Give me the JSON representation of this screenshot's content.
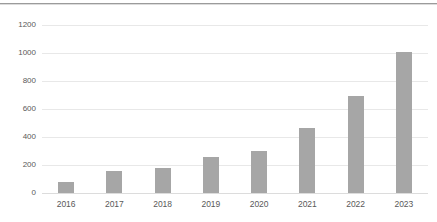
{
  "chart_data": {
    "type": "bar",
    "title": "",
    "xlabel": "",
    "ylabel": "",
    "categories": [
      "2016",
      "2017",
      "2018",
      "2019",
      "2020",
      "2021",
      "2022",
      "2023"
    ],
    "values": [
      80,
      155,
      180,
      260,
      300,
      465,
      690,
      1010
    ],
    "ylim": [
      0,
      1200
    ],
    "ytick_interval": 200,
    "ytick_labels": [
      "0",
      "200",
      "400",
      "600",
      "800",
      "1000",
      "1200"
    ],
    "grid": true,
    "legend": "none",
    "colors": {
      "bar": "#a6a6a6",
      "gridline": "#e8e8e8",
      "axis_label": "#595959",
      "top_rule": "#9b9b9b",
      "background": "#ffffff"
    }
  }
}
